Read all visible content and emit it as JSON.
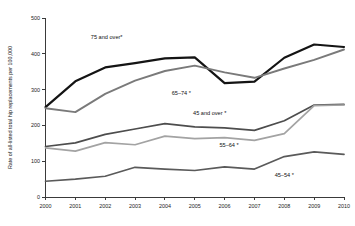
{
  "chart_data": {
    "type": "line",
    "title": "",
    "subtitle": "",
    "xlabel": "",
    "ylabel": "Rate of all-listed total hip replacements per 100,000",
    "x": [
      2000,
      2001,
      2002,
      2003,
      2004,
      2005,
      2006,
      2007,
      2008,
      2009,
      2010
    ],
    "categories": [
      "2000",
      "2001",
      "2002",
      "2003",
      "2004",
      "2005",
      "2006",
      "2007",
      "2008",
      "2009",
      "2010"
    ],
    "xlim": [
      2000,
      2010
    ],
    "ylim": [
      0,
      500
    ],
    "yticks": [
      0,
      100,
      200,
      300,
      400,
      500
    ],
    "ytick_labels": [
      "0",
      "100",
      "200",
      "300",
      "400",
      "500"
    ],
    "grid": false,
    "legend": "inline-labels",
    "series": [
      {
        "name": "75 and over*",
        "label": "75 and over*",
        "color": "#141414",
        "width": 2.2,
        "values": [
          251,
          323,
          362,
          374,
          387,
          390,
          318,
          322,
          389,
          426,
          419
        ],
        "label_x": 2002.05,
        "label_y": 440
      },
      {
        "name": "65–74*",
        "label": "65–74 *",
        "color": "#7a7a7a",
        "width": 1.9,
        "values": [
          248,
          237,
          288,
          325,
          352,
          367,
          348,
          333,
          359,
          383,
          412
        ],
        "label_x": 2004.55,
        "label_y": 286
      },
      {
        "name": "45 and over*",
        "label": "45 and over *",
        "color": "#4d4d4d",
        "width": 1.7,
        "values": [
          141,
          151,
          175,
          190,
          205,
          196,
          193,
          186,
          213,
          257,
          259
        ],
        "label_x": 2005.5,
        "label_y": 228
      },
      {
        "name": "55–64*",
        "label": "55–64 *",
        "color": "#a3a3a3",
        "width": 1.7,
        "values": [
          137,
          128,
          152,
          146,
          170,
          163,
          166,
          158,
          177,
          255,
          257
        ],
        "label_x": 2006.15,
        "label_y": 140
      },
      {
        "name": "45–54*",
        "label": "45–54 *",
        "color": "#5a5a5a",
        "width": 1.7,
        "values": [
          44,
          50,
          58,
          83,
          78,
          74,
          84,
          78,
          113,
          126,
          119
        ],
        "label_x": 2008.0,
        "label_y": 56
      }
    ]
  },
  "axis": {
    "y_title": "Rate of all-listed total hip replacements per 100,000"
  }
}
